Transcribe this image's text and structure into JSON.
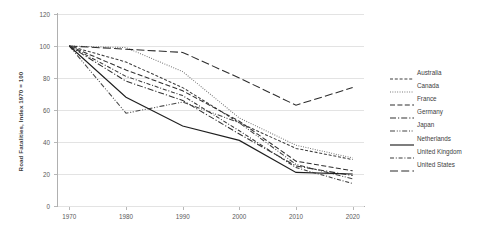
{
  "chart_data": {
    "type": "line",
    "title": "",
    "subtitle": "",
    "xlabel": "",
    "ylabel": "Road Fatalities, Index 1970 = 100",
    "x": [
      1970,
      1980,
      1990,
      2000,
      2010,
      2020
    ],
    "xtick_labels": [
      "1970",
      "1980",
      "1990",
      "2000",
      "2010",
      "2020"
    ],
    "ytick_labels": [
      "0",
      "20",
      "40",
      "60",
      "80",
      "100",
      "120"
    ],
    "ylim": [
      0,
      120
    ],
    "xlim": [
      1968,
      2022
    ],
    "grid": true,
    "legend_position": "right",
    "series": [
      {
        "name": "Australia",
        "dash": "dashed",
        "color": "#3f3f3f",
        "values": [
          100,
          90,
          74,
          52,
          36,
          29
        ]
      },
      {
        "name": "Canada",
        "dash": "dotted",
        "color": "#6e6e6e",
        "values": [
          100,
          99,
          84,
          55,
          38,
          30
        ]
      },
      {
        "name": "France",
        "dash": "long-dash",
        "color": "#2f2f2f",
        "values": [
          100,
          85,
          72,
          53,
          28,
          22
        ]
      },
      {
        "name": "Germany",
        "dash": "dash-dot",
        "color": "#333333",
        "values": [
          100,
          78,
          66,
          45,
          25,
          19
        ]
      },
      {
        "name": "Japan",
        "dash": "dash-dot-dot",
        "color": "#454545",
        "values": [
          100,
          58,
          65,
          52,
          26,
          17
        ]
      },
      {
        "name": "Netherlands",
        "dash": "solid",
        "color": "#1f1f1f",
        "values": [
          100,
          68,
          50,
          41,
          21,
          20
        ]
      },
      {
        "name": "United Kingdom",
        "dash": "dash-dot-short",
        "color": "#3a3a3a",
        "values": [
          100,
          81,
          69,
          47,
          24,
          14
        ]
      },
      {
        "name": "United States",
        "dash": "extra-long-dash",
        "color": "#2b2b2b",
        "values": [
          100,
          98,
          96,
          80,
          63,
          74
        ]
      }
    ]
  }
}
